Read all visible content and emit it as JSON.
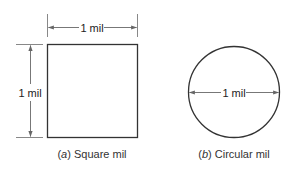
{
  "figure": {
    "panel_a": {
      "shape": "square",
      "top_dimension_label": "1 mil",
      "side_dimension_label": "1 mil",
      "caption_letter": "a",
      "caption_text": " Square mil"
    },
    "panel_b": {
      "shape": "circle",
      "diameter_label": "1 mil",
      "caption_letter": "b",
      "caption_text": " Circular mil"
    },
    "colors": {
      "outline": "#333333",
      "dimension_line": "#777777",
      "text": "#222222"
    }
  }
}
